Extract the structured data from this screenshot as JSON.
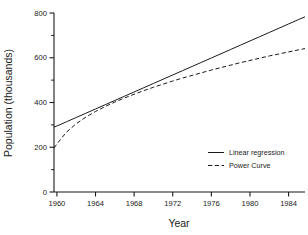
{
  "chart_data": {
    "type": "line",
    "title": "",
    "xlabel": "Year",
    "ylabel": "Population (thousands)",
    "xlim": [
      1959.7,
      1985.7
    ],
    "ylim": [
      0,
      800
    ],
    "grid": false,
    "legend_position": "inside-lower-right",
    "x_ticks": [
      1960,
      1964,
      1968,
      1972,
      1976,
      1980,
      1984
    ],
    "x_tick_labels": [
      "1960",
      "1964",
      "1968",
      "1972",
      "1976",
      "1980",
      "1984"
    ],
    "y_ticks": [
      0,
      200,
      400,
      600,
      800
    ],
    "y_tick_labels": [
      "0",
      "200",
      "400",
      "600",
      "800"
    ],
    "y_minor_ticks": [
      100,
      300,
      500,
      700
    ],
    "x": [
      1959.7,
      1960,
      1961,
      1962,
      1963,
      1964,
      1965,
      1966,
      1967,
      1968,
      1969,
      1970,
      1971,
      1972,
      1973,
      1974,
      1975,
      1976,
      1977,
      1978,
      1979,
      1980,
      1981,
      1982,
      1983,
      1984,
      1985,
      1985.7
    ],
    "series": [
      {
        "name": "Linear regression",
        "style": "solid",
        "color": "#1a1a1a",
        "values": [
          290,
          295,
          314,
          333,
          352,
          371,
          390,
          409,
          428,
          447,
          466,
          485,
          504,
          523,
          542,
          561,
          580,
          599,
          618,
          637,
          656,
          675,
          694,
          713,
          732,
          751,
          770,
          783
        ]
      },
      {
        "name": "Power Curve",
        "style": "dashed",
        "color": "#1a1a1a",
        "values": [
          196,
          215,
          268,
          305,
          335,
          360,
          382,
          402,
          420,
          437,
          453,
          468,
          482,
          496,
          509,
          521,
          533,
          545,
          556,
          567,
          578,
          588,
          598,
          608,
          617,
          626,
          635,
          641
        ]
      }
    ],
    "legend": [
      {
        "label": "Linear regression",
        "style": "solid"
      },
      {
        "label": "Power Curve",
        "style": "dashed"
      }
    ],
    "colors": {
      "ink": "#1a1a1a",
      "background": "#ffffff"
    }
  }
}
